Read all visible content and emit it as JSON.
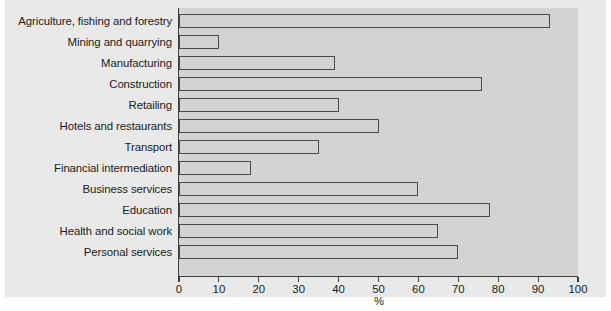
{
  "chart_data": {
    "type": "bar",
    "orientation": "horizontal",
    "title": "",
    "xlabel": "%",
    "ylabel": "",
    "xlim": [
      0,
      100
    ],
    "xticks": [
      0,
      10,
      20,
      30,
      40,
      50,
      60,
      70,
      80,
      90,
      100
    ],
    "xtick_labels": [
      "0",
      "10",
      "20",
      "30",
      "40",
      "50",
      "60",
      "70",
      "80",
      "90",
      "100"
    ],
    "grid": false,
    "legend": null,
    "categories": [
      "Agriculture, fishing and forestry",
      "Mining and quarrying",
      "Manufacturing",
      "Construction",
      "Retailing",
      "Hotels and restaurants",
      "Transport",
      "Financial intermediation",
      "Business services",
      "Education",
      "Health and social work",
      "Personal services"
    ],
    "values": [
      93,
      10,
      39,
      76,
      40,
      50,
      35,
      18,
      60,
      78,
      65,
      70
    ],
    "bar_style": {
      "fill": "#d3d3d3",
      "edge": "#4a4a4a",
      "plot_background": "#d3d3d3",
      "panel_background": "#e9e9e9",
      "figure_background": "#ffffff",
      "text_color": "#1b1b1b"
    }
  }
}
